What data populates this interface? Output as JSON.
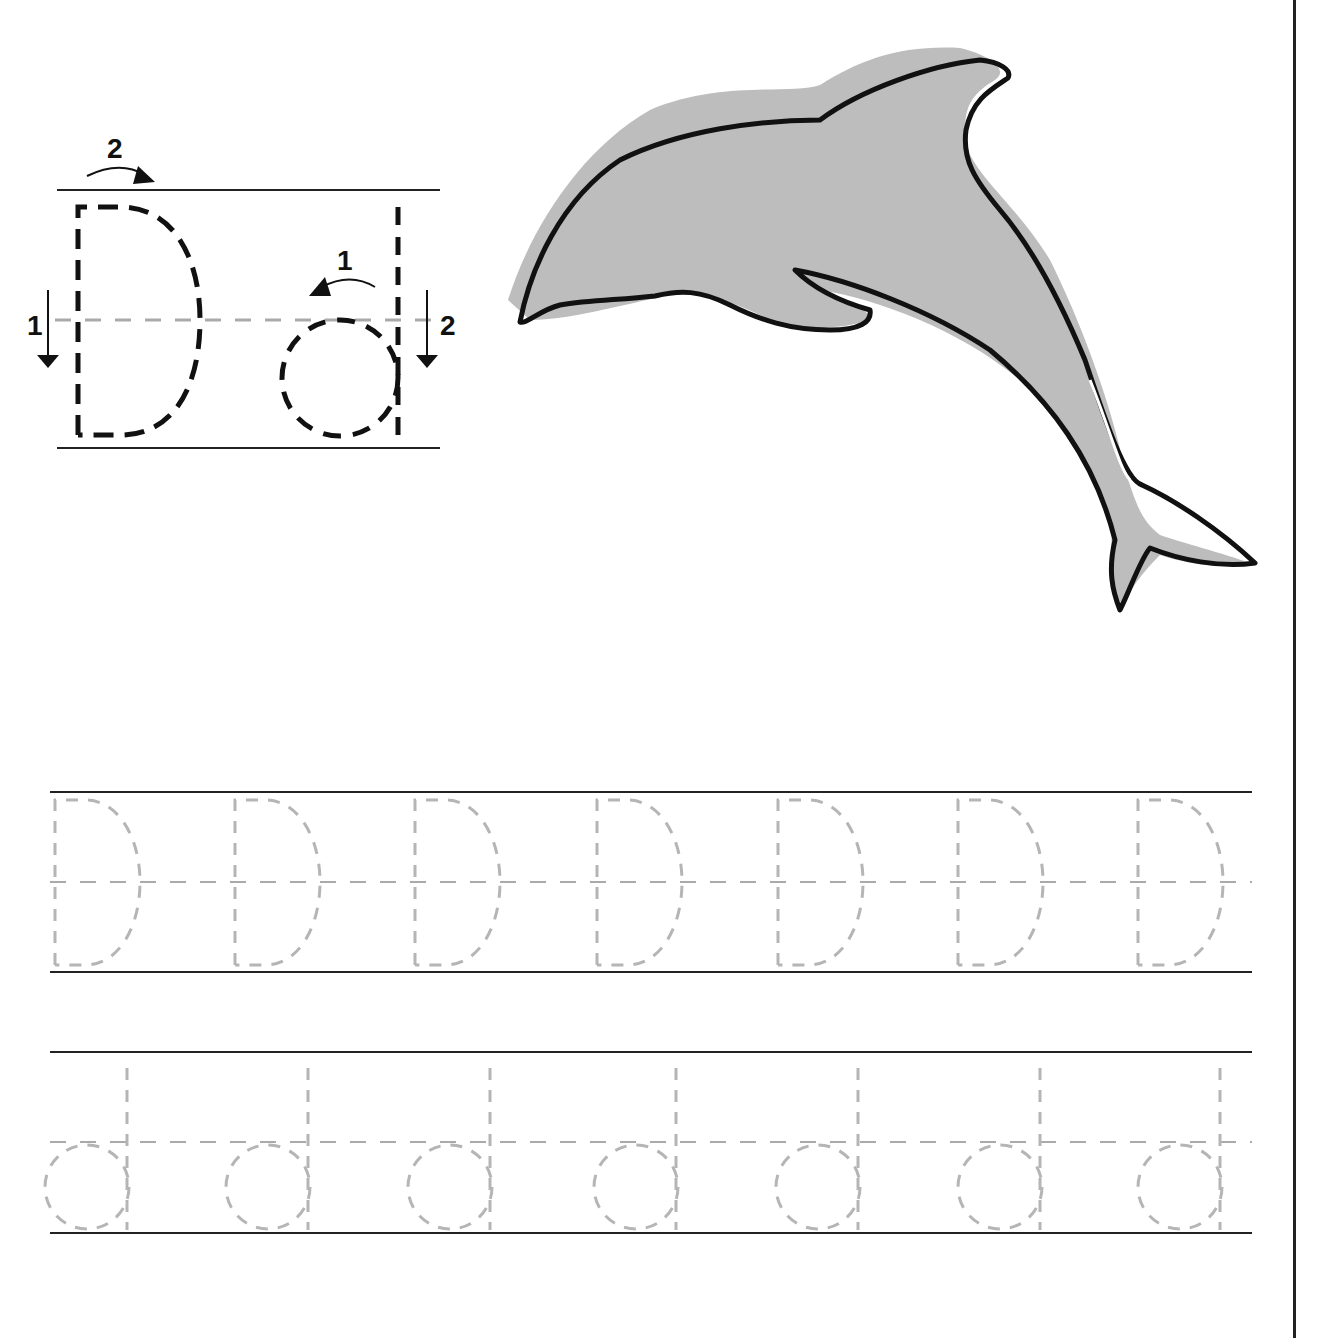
{
  "worksheet": {
    "letter_upper": "D",
    "letter_lower": "d",
    "illustration": "dolphin",
    "guide": {
      "upper_steps": [
        {
          "number": "1",
          "direction": "down"
        },
        {
          "number": "2",
          "direction": "curve-right"
        }
      ],
      "lower_steps": [
        {
          "number": "1",
          "direction": "curve-left"
        },
        {
          "number": "2",
          "direction": "down"
        }
      ]
    },
    "practice_rows": [
      {
        "case": "upper",
        "letters": [
          "D",
          "D",
          "D",
          "D",
          "D",
          "D",
          "D"
        ]
      },
      {
        "case": "lower",
        "letters": [
          "d",
          "d",
          "d",
          "d",
          "d",
          "d",
          "d"
        ]
      }
    ],
    "colors": {
      "ink": "#111111",
      "trace": "#b5b5b5",
      "dolphin_fill": "#bdbdbd",
      "guideline": "#222222",
      "midline": "#aaaaaa"
    }
  }
}
